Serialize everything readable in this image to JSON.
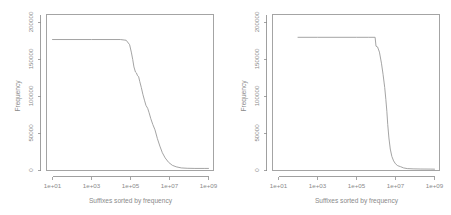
{
  "figure": {
    "panel_count": 2,
    "background_color": "#ffffff",
    "line_color": "#9a9a9a",
    "axis_color": "#8d8d8d",
    "text_color": "#8a8a8a"
  },
  "chart_data": [
    {
      "type": "line",
      "panel": "left",
      "title": "",
      "xlabel": "Suffixes sorted by frequency",
      "ylabel": "Frequency",
      "xscale": "log",
      "yscale": "linear",
      "xlim": [
        1,
        5000000000
      ],
      "ylim": [
        0,
        210000
      ],
      "grid": false,
      "legend": "none",
      "xticks": [
        10,
        1000,
        100000,
        10000000,
        1000000000
      ],
      "xticklabels": [
        "1e+01",
        "1e+03",
        "1e+05",
        "1e+07",
        "1e+09"
      ],
      "yticks": [
        0,
        50000,
        100000,
        150000,
        200000
      ],
      "yticklabels": [
        "0",
        "50000",
        "100000",
        "150000",
        "200000"
      ],
      "series": [
        {
          "name": "suffix frequency",
          "x": [
            10,
            100,
            1000,
            10000,
            30000,
            60000,
            90000,
            110000,
            130000,
            150000,
            180000,
            200000,
            230000,
            260000,
            300000,
            360000,
            430000,
            520000,
            620000,
            760000,
            900000,
            1100000,
            1400000,
            1800000,
            2400000,
            3200000,
            4300000,
            6000000,
            9000000,
            14000000,
            22000000,
            40000000,
            80000000,
            200000000,
            600000000,
            1000000000
          ],
          "y": [
            177000,
            177000,
            177000,
            177000,
            177000,
            176000,
            170000,
            160000,
            150000,
            140000,
            133000,
            132000,
            128000,
            127000,
            120000,
            112000,
            103000,
            95000,
            88000,
            84000,
            78000,
            70000,
            62000,
            55000,
            43000,
            33000,
            24000,
            17000,
            11000,
            7000,
            5000,
            3500,
            3000,
            2800,
            2800,
            2800
          ]
        }
      ]
    },
    {
      "type": "line",
      "panel": "right",
      "title": "",
      "xlabel": "Suffixes sorted by frequency",
      "ylabel": "Frequency",
      "xscale": "log",
      "yscale": "linear",
      "xlim": [
        1,
        5000000000
      ],
      "ylim": [
        0,
        210000
      ],
      "grid": false,
      "legend": "none",
      "xticks": [
        10,
        1000,
        100000,
        10000000,
        1000000000
      ],
      "xticklabels": [
        "1e+01",
        "1e+03",
        "1e+05",
        "1e+07",
        "1e+09"
      ],
      "yticks": [
        0,
        50000,
        100000,
        150000,
        200000
      ],
      "yticklabels": [
        "0",
        "50000",
        "100000",
        "150000",
        "200000"
      ],
      "series": [
        {
          "name": "suffix frequency",
          "x": [
            100,
            1000,
            10000,
            100000,
            400000,
            900000,
            1000000,
            1200000,
            1500000,
            1900000,
            2300000,
            2800000,
            3200000,
            3600000,
            4000000,
            4600000,
            5400000,
            6500000,
            8000000,
            10000000,
            13000000,
            18000000,
            26000000,
            40000000,
            80000000,
            200000000,
            600000000,
            1000000000
          ],
          "y": [
            180000,
            180000,
            180000,
            180000,
            180000,
            180000,
            168000,
            167000,
            160000,
            145000,
            130000,
            112000,
            96000,
            80000,
            62000,
            44000,
            29000,
            19000,
            13000,
            9000,
            6500,
            5200,
            3500,
            2600,
            2200,
            2000,
            1900,
            1800
          ]
        }
      ]
    }
  ]
}
